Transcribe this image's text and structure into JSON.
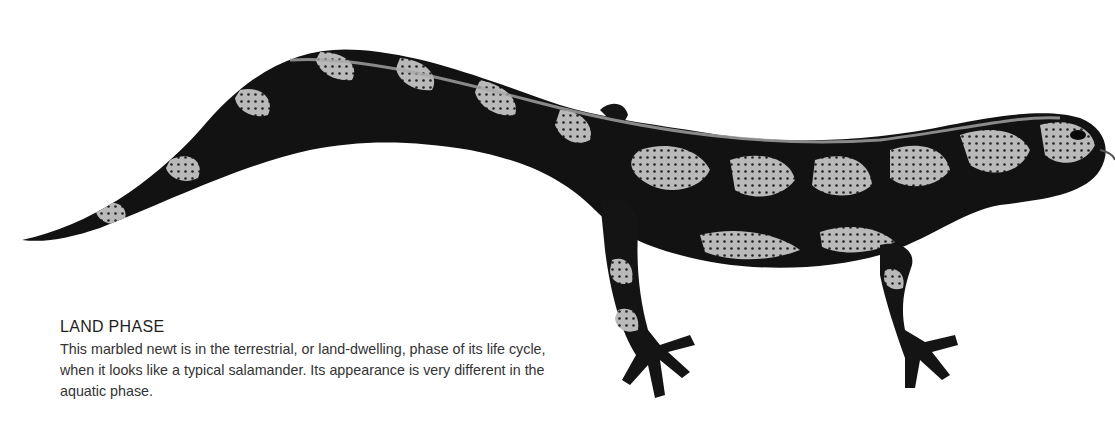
{
  "caption": {
    "title": "LAND PHASE",
    "body": "This marbled newt is in the terrestrial, or land-dwelling, phase of its life cycle, when it looks like a typical salamander. Its appearance is very different in the aquatic phase."
  },
  "illustration": {
    "subject": "marbled newt (land phase)",
    "palette": {
      "dark": "#111111",
      "light": "#b8b8b8",
      "background": "#ffffff"
    }
  }
}
